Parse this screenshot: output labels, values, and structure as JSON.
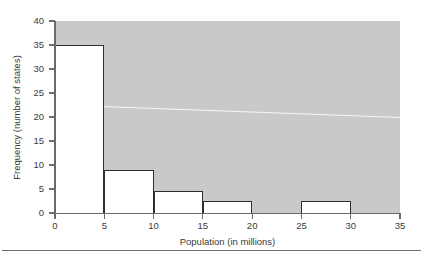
{
  "chart_data": {
    "type": "bar",
    "title": "",
    "subtitle": "",
    "xlabel": "Population (in millions)",
    "ylabel": "Frequency (number of states)",
    "xlim": [
      0,
      35
    ],
    "ylim": [
      0,
      40
    ],
    "grid": false,
    "legend": null,
    "bin_width": 5,
    "bin_edges": [
      0,
      5,
      10,
      15,
      20,
      25,
      30,
      35
    ],
    "categories": [
      "0-5",
      "5-10",
      "10-15",
      "15-20",
      "20-25",
      "25-30",
      "30-35"
    ],
    "values": [
      35,
      9,
      4.5,
      2.5,
      0,
      2.5,
      0
    ],
    "xticks": [
      "0",
      "5",
      "10",
      "15",
      "20",
      "25",
      "30",
      "35"
    ],
    "xtick_values": [
      0,
      5,
      10,
      15,
      20,
      25,
      30,
      35
    ],
    "yticks": [
      "0",
      "5",
      "10",
      "15",
      "20",
      "25",
      "30",
      "35",
      "40"
    ],
    "ytick_values": [
      0,
      5,
      10,
      15,
      20,
      25,
      30,
      35,
      40
    ],
    "annotations": []
  },
  "style": {
    "plot_background": "#c9c9c9",
    "bar_fill": "#ffffff",
    "bar_outline": "#2e2e2e",
    "axis_color": "#6b6b6b",
    "text_color": "#3b3b3b",
    "page_background": "#ffffff"
  }
}
